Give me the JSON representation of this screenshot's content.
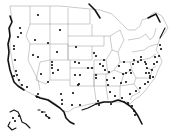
{
  "map": {
    "subject": "United States locations map",
    "background_color": "#ffffff",
    "outline_color": "#8a8a8a",
    "coast_color": "#111111",
    "marker_color": "#111111",
    "markers": [
      [
        38,
        15
      ],
      [
        60,
        30
      ],
      [
        20,
        28
      ],
      [
        21,
        33
      ],
      [
        18,
        37
      ],
      [
        14,
        46
      ],
      [
        14,
        49
      ],
      [
        15,
        60
      ],
      [
        16,
        71
      ],
      [
        17,
        75
      ],
      [
        14,
        76
      ],
      [
        19,
        80
      ],
      [
        22,
        85
      ],
      [
        27,
        87
      ],
      [
        35,
        40
      ],
      [
        33,
        55
      ],
      [
        38,
        57
      ],
      [
        48,
        43
      ],
      [
        57,
        52
      ],
      [
        52,
        62
      ],
      [
        52,
        65
      ],
      [
        52,
        68
      ],
      [
        53,
        73
      ],
      [
        58,
        70
      ],
      [
        41,
        74
      ],
      [
        48,
        82
      ],
      [
        38,
        94
      ],
      [
        37,
        97
      ],
      [
        61,
        94
      ],
      [
        73,
        93
      ],
      [
        78,
        85
      ],
      [
        62,
        100
      ],
      [
        62,
        104
      ],
      [
        72,
        105
      ],
      [
        80,
        105
      ],
      [
        76,
        47
      ],
      [
        75,
        62
      ],
      [
        79,
        63
      ],
      [
        75,
        75
      ],
      [
        80,
        75
      ],
      [
        79,
        84
      ],
      [
        96,
        75
      ],
      [
        96,
        78
      ],
      [
        88,
        68
      ],
      [
        92,
        68
      ],
      [
        94,
        53
      ],
      [
        96,
        56
      ],
      [
        100,
        64
      ],
      [
        103,
        66
      ],
      [
        104,
        60
      ],
      [
        105,
        70
      ],
      [
        109,
        72
      ],
      [
        107,
        80
      ],
      [
        114,
        78
      ],
      [
        108,
        85
      ],
      [
        119,
        66
      ],
      [
        124,
        62
      ],
      [
        123,
        74
      ],
      [
        126,
        73
      ],
      [
        130,
        70
      ],
      [
        131,
        73
      ],
      [
        133,
        64
      ],
      [
        134,
        60
      ],
      [
        138,
        62
      ],
      [
        141,
        60
      ],
      [
        141,
        57
      ],
      [
        145,
        62
      ],
      [
        146,
        64
      ],
      [
        147,
        68
      ],
      [
        146,
        73
      ],
      [
        149,
        73
      ],
      [
        150,
        76
      ],
      [
        152,
        70
      ],
      [
        154,
        64
      ],
      [
        157,
        62
      ],
      [
        155,
        57
      ],
      [
        159,
        56
      ],
      [
        161,
        49
      ],
      [
        160,
        45
      ],
      [
        126,
        82
      ],
      [
        121,
        83
      ],
      [
        110,
        92
      ],
      [
        115,
        96
      ],
      [
        122,
        98
      ],
      [
        130,
        94
      ],
      [
        136,
        91
      ],
      [
        140,
        88
      ],
      [
        145,
        84
      ],
      [
        148,
        82
      ],
      [
        150,
        78
      ],
      [
        153,
        77
      ],
      [
        98,
        101
      ],
      [
        99,
        105
      ],
      [
        111,
        104
      ],
      [
        128,
        103
      ],
      [
        132,
        106
      ],
      [
        134,
        111
      ],
      [
        135,
        115
      ]
    ],
    "alaska_markers": [
      [
        13,
        118
      ],
      [
        15,
        121
      ],
      [
        19,
        116
      ]
    ],
    "hawaii_markers": [
      [
        42,
        112
      ],
      [
        46,
        115
      ],
      [
        49,
        118
      ]
    ]
  }
}
